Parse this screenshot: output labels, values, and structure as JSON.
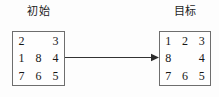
{
  "diagram": {
    "title_initial": "初始",
    "title_goal": "目标",
    "arrow": {
      "icon": "right-arrow-icon",
      "direction": "left-to-right",
      "color": "#333333"
    },
    "border_color": "#6e6e6e",
    "text_color": "#161616",
    "background": "#fdfdfd",
    "blank_label": "",
    "states": [
      {
        "name": "initial-state",
        "caption": "初始",
        "rows": [
          [
            "2",
            "",
            "3"
          ],
          [
            "1",
            "8",
            "4"
          ],
          [
            "7",
            "6",
            "5"
          ]
        ]
      },
      {
        "name": "goal-state",
        "caption": "目标",
        "rows": [
          [
            "1",
            "2",
            "3"
          ],
          [
            "8",
            "",
            "4"
          ],
          [
            "7",
            "6",
            "5"
          ]
        ]
      }
    ]
  }
}
